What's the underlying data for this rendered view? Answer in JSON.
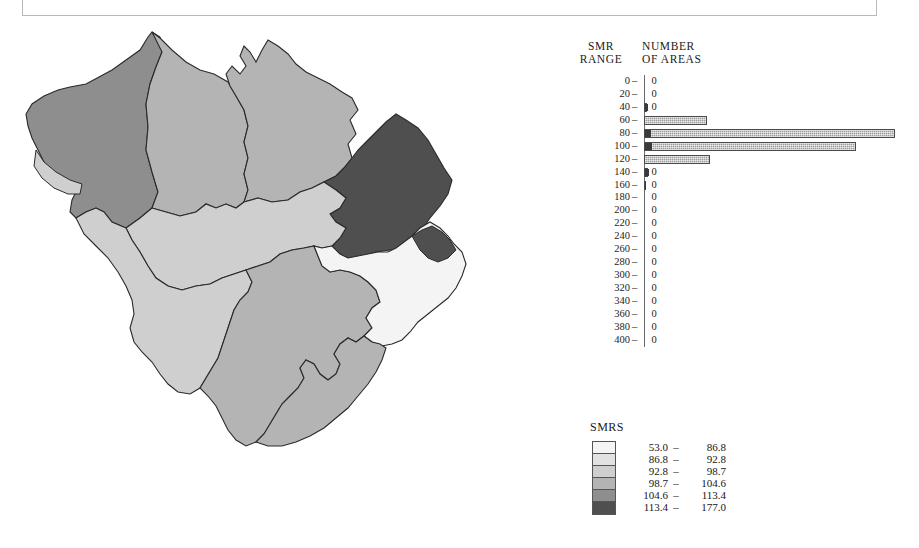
{
  "caption": {
    "text": "SELECTED MAP OF STANDARDISED MORTALITY RATIOS : BELGIUM, ALL MALIGNANT NEOPLASMS"
  },
  "histogram": {
    "title_left": "SMR\nRANGE",
    "title_left_line1": "SMR",
    "title_left_line2": "RANGE",
    "title_right_line1": "NUMBER",
    "title_right_line2": "OF AREAS",
    "dash": "–"
  },
  "legend": {
    "title": "SMRS",
    "separator": "–",
    "classes": [
      {
        "low": "53.0",
        "high": "86.8",
        "color": "#f4f4f4"
      },
      {
        "low": "86.8",
        "high": "92.8",
        "color": "#e2e2e2"
      },
      {
        "low": "92.8",
        "high": "98.7",
        "color": "#cfcfcf"
      },
      {
        "low": "98.7",
        "high": "104.6",
        "color": "#b4b4b4"
      },
      {
        "low": "104.6",
        "high": "113.4",
        "color": "#8e8e8e"
      },
      {
        "low": "113.4",
        "high": "177.0",
        "color": "#4f4f4f"
      }
    ]
  },
  "chart_data": {
    "type": "bar",
    "orientation": "horizontal",
    "xlabel": "NUMBER OF AREAS",
    "ylabel": "SMR RANGE",
    "grid": false,
    "legend_position": "none",
    "categories": [
      "0",
      "20",
      "40",
      "60",
      "80",
      "100",
      "120",
      "140",
      "160",
      "180",
      "200",
      "220",
      "240",
      "260",
      "280",
      "300",
      "320",
      "340",
      "360",
      "380",
      "400"
    ],
    "values": [
      0,
      0,
      0,
      0,
      4,
      5,
      0,
      0,
      0,
      0,
      0,
      0,
      0,
      0,
      0,
      0,
      0,
      0,
      0,
      0,
      0
    ],
    "bar_pixel_lengths": [
      0,
      0,
      0,
      3,
      32,
      248,
      209,
      38,
      4,
      1,
      0,
      0,
      0,
      0,
      0,
      0,
      0,
      0,
      0,
      0,
      0
    ],
    "bars": [
      {
        "range": "0",
        "count": "0",
        "len": 0,
        "dark": 0
      },
      {
        "range": "20",
        "count": "0",
        "len": 0,
        "dark": 0
      },
      {
        "range": "40",
        "count": "0",
        "len": 3,
        "dark": 3
      },
      {
        "range": "60",
        "count": "0",
        "len": 63,
        "dark": 0
      },
      {
        "range": "80",
        "count": "4",
        "len": 251,
        "dark": 6
      },
      {
        "range": "100",
        "count": "5",
        "len": 212,
        "dark": 7
      },
      {
        "range": "120",
        "count": "0",
        "len": 66,
        "dark": 0
      },
      {
        "range": "140",
        "count": "0",
        "len": 4,
        "dark": 4
      },
      {
        "range": "160",
        "count": "0",
        "len": 1,
        "dark": 1
      },
      {
        "range": "180",
        "count": "0",
        "len": 0,
        "dark": 0
      },
      {
        "range": "200",
        "count": "0",
        "len": 0,
        "dark": 0
      },
      {
        "range": "220",
        "count": "0",
        "len": 0,
        "dark": 0
      },
      {
        "range": "240",
        "count": "0",
        "len": 0,
        "dark": 0
      },
      {
        "range": "260",
        "count": "0",
        "len": 0,
        "dark": 0
      },
      {
        "range": "280",
        "count": "0",
        "len": 0,
        "dark": 0
      },
      {
        "range": "300",
        "count": "0",
        "len": 0,
        "dark": 0
      },
      {
        "range": "320",
        "count": "0",
        "len": 0,
        "dark": 0
      },
      {
        "range": "340",
        "count": "0",
        "len": 0,
        "dark": 0
      },
      {
        "range": "360",
        "count": "0",
        "len": 0,
        "dark": 0
      },
      {
        "range": "380",
        "count": "0",
        "len": 0,
        "dark": 0
      },
      {
        "range": "400",
        "count": "0",
        "len": 0,
        "dark": 0
      }
    ]
  },
  "map": {
    "name": "belgium-smr-choropleth",
    "outline_color": "#2a2a2a",
    "regions": [
      {
        "id": "west-vlaanderen",
        "class_index": 4,
        "fill": "#8e8e8e"
      },
      {
        "id": "west-coast-strip",
        "class_index": 2,
        "fill": "#cfcfcf"
      },
      {
        "id": "oost-vlaanderen",
        "class_index": 3,
        "fill": "#b4b4b4"
      },
      {
        "id": "antwerpen",
        "class_index": 3,
        "fill": "#b4b4b4"
      },
      {
        "id": "limburg",
        "class_index": 5,
        "fill": "#4f4f4f"
      },
      {
        "id": "vlaams-brabant",
        "class_index": 2,
        "fill": "#cfcfcf"
      },
      {
        "id": "hainaut",
        "class_index": 2,
        "fill": "#cfcfcf"
      },
      {
        "id": "namur",
        "class_index": 3,
        "fill": "#b4b4b4"
      },
      {
        "id": "liege",
        "class_index": 0,
        "fill": "#f4f4f4"
      },
      {
        "id": "luxembourg",
        "class_index": 3,
        "fill": "#b4b4b4"
      },
      {
        "id": "east-cantons",
        "class_index": 5,
        "fill": "#4f4f4f"
      }
    ]
  }
}
